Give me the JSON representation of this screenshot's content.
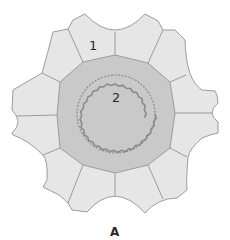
{
  "figure": {
    "caption": "A",
    "labels": [
      {
        "id": "1",
        "text": "1",
        "region": "outer-cell"
      },
      {
        "id": "2",
        "text": "2",
        "region": "central-core"
      }
    ]
  },
  "colors": {
    "outer_cells": "#e6e6e6",
    "core": "#c8c8c8",
    "outline": "#9c9c9c",
    "wavy_ring": "#8a8a8a"
  }
}
